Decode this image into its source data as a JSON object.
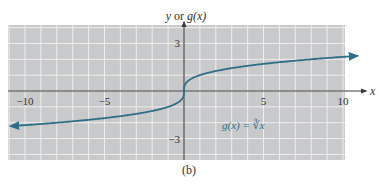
{
  "chart_data": {
    "type": "line",
    "title": "",
    "caption": "(b)",
    "xlabel": "x",
    "ylabel": "y or g(x)",
    "xlim": [
      -11,
      10.1
    ],
    "ylim": [
      -4.3,
      4.2
    ],
    "grid": true,
    "grid_step": 1,
    "x_ticks": [
      -10,
      -5,
      5,
      10
    ],
    "x_tick_labels": [
      "−10",
      "−5",
      "5",
      "10"
    ],
    "y_ticks": [
      3,
      -3
    ],
    "y_tick_labels": [
      "3",
      "−3"
    ],
    "series": [
      {
        "name": "g(x) = ∛x",
        "function": "cube_root",
        "x_range": [
          -10.9,
          10.9
        ],
        "x": [
          -10.9,
          -8,
          -5,
          -3,
          -1,
          -0.5,
          0,
          0.5,
          1,
          3,
          5,
          8,
          10.9
        ],
        "y": [
          -2.22,
          -2,
          -1.71,
          -1.44,
          -1,
          -0.79,
          0,
          0.79,
          1,
          1.44,
          1.71,
          2,
          2.22
        ],
        "color": "#2e6f86",
        "arrows": "both"
      }
    ],
    "annotations": [
      {
        "text": "g(x) = ∛x",
        "x": 4.5,
        "y": -2.2
      }
    ]
  },
  "labels": {
    "y_axis": "y or g(x)",
    "x_axis": "x",
    "annotation": "g(x) = ∛x",
    "caption": "(b)"
  },
  "colors": {
    "plot_bg": "#c8c9cb",
    "grid": "#eeeeee",
    "axis": "#3a3a3a",
    "curve": "#2e6f86"
  }
}
